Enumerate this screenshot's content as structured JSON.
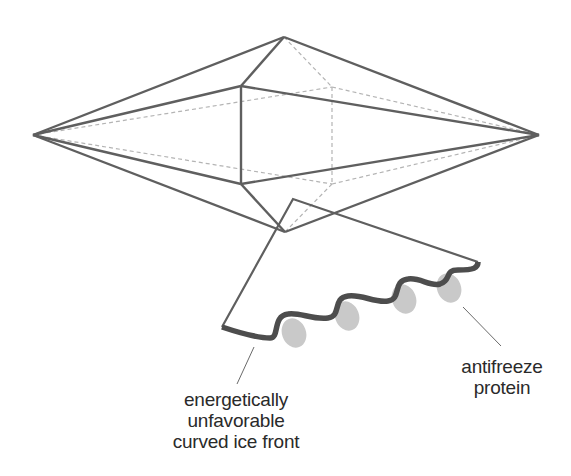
{
  "diagram": {
    "type": "ice crystal bipyramid with antifreeze proteins on curved ice front",
    "colors": {
      "edge": "#5f5f5f",
      "hidden_edge": "#b4b4b4",
      "ice_front": "#4d4d4d",
      "protein": "#c9c9c9",
      "text": "#2a2a2a",
      "background": "#ffffff"
    },
    "crystal_vertices": {
      "left": [
        33,
        135
      ],
      "right": [
        539,
        135
      ],
      "top": [
        284,
        37
      ],
      "bottom": [
        285,
        232
      ],
      "front_upper": [
        241,
        86
      ],
      "front_lower": [
        241,
        184
      ],
      "back_upper": [
        332,
        87
      ],
      "back_lower": [
        332,
        184
      ]
    },
    "proteins_count": 4
  },
  "labels": {
    "ice_front": {
      "lines": [
        "energetically",
        "unfavorable",
        "curved ice front"
      ]
    },
    "protein": {
      "lines": [
        "antifreeze",
        "protein"
      ]
    }
  }
}
